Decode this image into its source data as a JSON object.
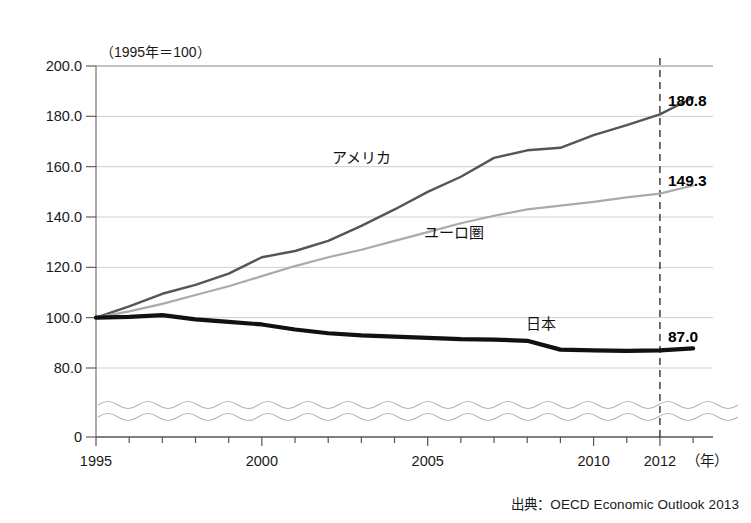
{
  "chart_data": {
    "type": "line",
    "title": "",
    "unit_note": "（1995年＝100）",
    "xlabel": "（年）",
    "ylabel": "",
    "xlim": [
      1995,
      2013.6
    ],
    "ylim": [
      80,
      200
    ],
    "y_axis_break": true,
    "y_break_base": 0,
    "grid": true,
    "legend": "inline-annotations",
    "ytick_labels": [
      "200.0",
      "180.0",
      "160.0",
      "140.0",
      "120.0",
      "100.0",
      "80.0",
      "0"
    ],
    "yticks": [
      200,
      180,
      160,
      140,
      120,
      100,
      80,
      0
    ],
    "xtick_labels": [
      "1995",
      "2000",
      "2005",
      "2010",
      "2012"
    ],
    "xticks": [
      1995,
      2000,
      2005,
      2010,
      2012
    ],
    "x_minor_ticks": [
      1996,
      1997,
      1998,
      1999,
      2001,
      2002,
      2003,
      2004,
      2006,
      2007,
      2008,
      2009,
      2011,
      2013
    ],
    "marker_year": 2012,
    "marker_year_label": "2012",
    "x": [
      1995,
      1996,
      1997,
      1998,
      1999,
      2000,
      2001,
      2002,
      2003,
      2004,
      2005,
      2006,
      2007,
      2008,
      2009,
      2010,
      2011,
      2012,
      2013
    ],
    "series": [
      {
        "name": "アメリカ",
        "key": "usa",
        "color": "#555555",
        "width": 2.4,
        "end_label": "180.8",
        "label_x": 2003.0,
        "label_y": 161.5,
        "values": [
          100.0,
          104.5,
          109.5,
          113.0,
          117.5,
          124.0,
          126.5,
          130.5,
          136.5,
          143.0,
          150.0,
          156.0,
          163.5,
          166.5,
          167.5,
          172.5,
          176.5,
          180.8,
          187.5
        ]
      },
      {
        "name": "ユーロ圏",
        "key": "euro",
        "color": "#aaaaaa",
        "width": 2.2,
        "end_label": "149.3",
        "label_x": 2005.8,
        "label_y": 131.5,
        "values": [
          100.0,
          102.5,
          105.5,
          109.0,
          112.5,
          116.5,
          120.5,
          124.0,
          127.0,
          130.5,
          134.0,
          137.5,
          140.5,
          143.0,
          144.5,
          146.0,
          147.8,
          149.3,
          152.5
        ]
      },
      {
        "name": "日本",
        "key": "japan",
        "color": "#111111",
        "width": 4.2,
        "end_label": "87.0",
        "label_x": 2008.4,
        "label_y": 95.5,
        "values": [
          100.0,
          100.3,
          101.0,
          99.3,
          98.3,
          97.3,
          95.3,
          93.8,
          93.0,
          92.5,
          92.0,
          91.5,
          91.3,
          90.8,
          87.3,
          87.0,
          86.8,
          87.0,
          87.8
        ]
      }
    ],
    "value_labels": [
      {
        "text": "180.8",
        "series": "アメリカ",
        "x": 2012,
        "y": 180.8
      },
      {
        "text": "149.3",
        "series": "ユーロ圏",
        "x": 2012,
        "y": 149.3
      },
      {
        "text": "87.0",
        "series": "日本",
        "x": 2012,
        "y": 87.0
      }
    ]
  },
  "source": {
    "text": "出典：OECD Economic Outlook 2013"
  }
}
